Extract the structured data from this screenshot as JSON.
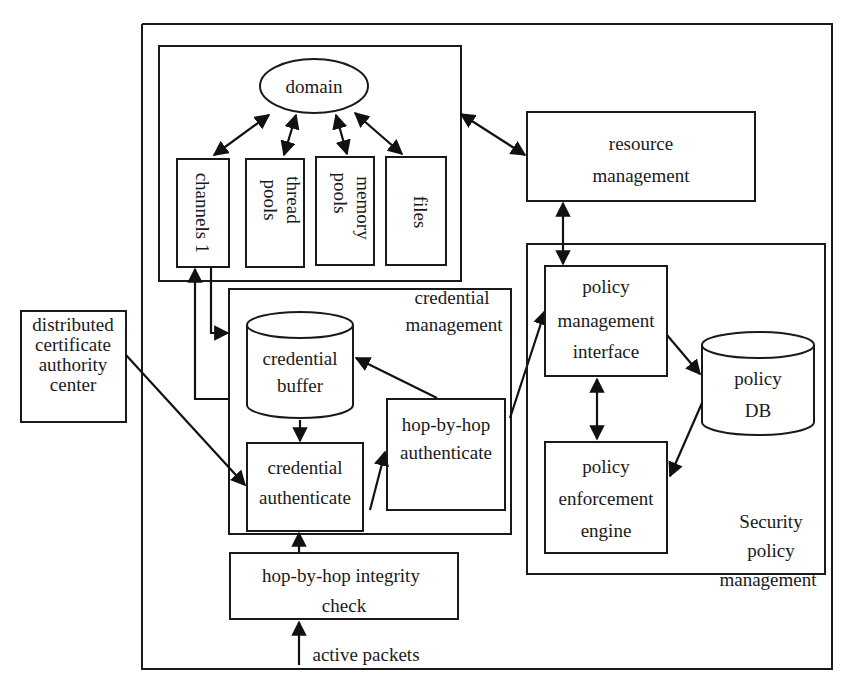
{
  "diagram": {
    "type": "system-architecture",
    "nodes": {
      "domain": "domain",
      "channels": "channels 1",
      "thread_pools_1": "thread",
      "thread_pools_2": "pools",
      "memory_pools_1": "memory",
      "memory_pools_2": "pools",
      "files": "files",
      "resource_management_1": "resource",
      "resource_management_2": "management",
      "distributed_ca_1": "distributed",
      "distributed_ca_2": "certificate",
      "distributed_ca_3": "authority",
      "distributed_ca_4": "center",
      "credential_management_1": "credential",
      "credential_management_2": "management",
      "credential_buffer_1": "credential",
      "credential_buffer_2": "buffer",
      "credential_authenticate_1": "credential",
      "credential_authenticate_2": "authenticate",
      "hop_authenticate_1": "hop-by-hop",
      "hop_authenticate_2": "authenticate",
      "policy_mgmt_interface_1": "policy",
      "policy_mgmt_interface_2": "management",
      "policy_mgmt_interface_3": "interface",
      "policy_db_1": "policy",
      "policy_db_2": "DB",
      "policy_enforcement_1": "policy",
      "policy_enforcement_2": "enforcement",
      "policy_enforcement_3": "engine",
      "security_policy_mgmt_1": "Security",
      "security_policy_mgmt_2": "policy",
      "security_policy_mgmt_3": "management",
      "integrity_check_1": "hop-by-hop integrity",
      "integrity_check_2": "check",
      "active_packets": "active packets"
    },
    "edges": [
      {
        "from": "domain",
        "to": "channels 1",
        "bidirectional": true
      },
      {
        "from": "domain",
        "to": "thread pools",
        "bidirectional": true
      },
      {
        "from": "domain",
        "to": "memory pools",
        "bidirectional": true
      },
      {
        "from": "domain",
        "to": "files",
        "bidirectional": true
      },
      {
        "from": "domain container",
        "to": "resource management",
        "bidirectional": true
      },
      {
        "from": "resource management",
        "to": "policy management interface",
        "bidirectional": true
      },
      {
        "from": "channels 1",
        "to": "credential buffer",
        "bidirectional": false
      },
      {
        "from": "credential management",
        "to": "channels 1",
        "bidirectional": false
      },
      {
        "from": "distributed certificate authority center",
        "to": "credential authenticate",
        "bidirectional": false
      },
      {
        "from": "credential buffer",
        "to": "credential authenticate",
        "bidirectional": false
      },
      {
        "from": "hop-by-hop authenticate",
        "to": "credential buffer",
        "bidirectional": false
      },
      {
        "from": "credential authenticate",
        "to": "hop-by-hop authenticate",
        "bidirectional": false
      },
      {
        "from": "hop-by-hop authenticate",
        "to": "policy management interface",
        "bidirectional": false
      },
      {
        "from": "policy management interface",
        "to": "policy DB",
        "bidirectional": false
      },
      {
        "from": "policy management interface",
        "to": "policy enforcement engine",
        "bidirectional": true
      },
      {
        "from": "policy DB",
        "to": "policy enforcement engine",
        "bidirectional": false
      },
      {
        "from": "hop-by-hop integrity check",
        "to": "credential authenticate",
        "bidirectional": false
      },
      {
        "from": "active packets",
        "to": "hop-by-hop integrity check",
        "bidirectional": false
      }
    ]
  }
}
